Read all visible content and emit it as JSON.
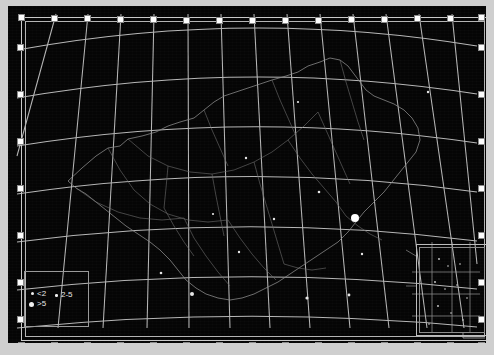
{
  "app": {
    "view_title": "Map Frame",
    "selection_state": "selected"
  },
  "map": {
    "title": "Map of China",
    "projection": "conic",
    "background_color": "#050505",
    "graticule_color": "#c8c8c8",
    "boundary_color": "#7d7d7d",
    "frame_color": "#c9c9c9",
    "handle_color": "#fdfdfd",
    "graticule": {
      "meridian_count": 14,
      "parallel_count": 7,
      "meridian_spacing_deg": 10,
      "parallel_spacing_deg": 10,
      "lon_min": 70,
      "lon_max": 140,
      "lat_min": 15,
      "lat_max": 55
    }
  },
  "legend": {
    "title": "",
    "items": [
      {
        "label": "<2",
        "symbol_size": 1.5
      },
      {
        "label": "2-5",
        "symbol_size": 2.0
      },
      {
        "label": ">5",
        "symbol_size": 3.0
      }
    ]
  },
  "inset": {
    "label": "",
    "description": "South China Sea islands inset"
  },
  "handles": {
    "top_count": 15,
    "bottom_count": 15,
    "left_count": 7,
    "right_count": 7
  }
}
